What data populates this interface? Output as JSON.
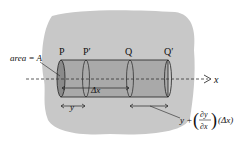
{
  "diagram": {
    "labels": {
      "area": "area = A",
      "P": "P",
      "P_prime": "P′",
      "Q": "Q",
      "Q_prime": "Q′",
      "axis": "x",
      "delta_x": "Δx",
      "y": "y",
      "y_plus": "y +",
      "partial_num": "∂y",
      "partial_den": "∂x",
      "delta_x_paren": "(Δx)"
    },
    "colors": {
      "background_blob": "#c8c8c8",
      "cylinder": "#a9a9a9",
      "stroke": "#222222"
    }
  }
}
